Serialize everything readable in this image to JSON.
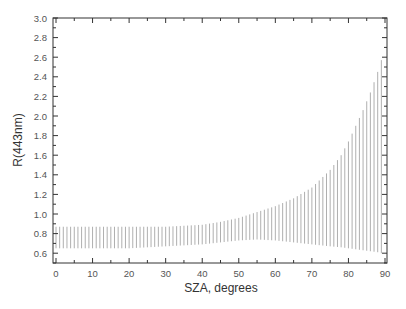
{
  "chart_data": {
    "type": "errorbar",
    "title": "",
    "xlabel": "SZA, degrees",
    "ylabel": "R(443nm)",
    "xlim": [
      -1,
      90
    ],
    "ylim": [
      0.5,
      3.0
    ],
    "grid": false,
    "legend": null,
    "x_ticks": [
      0,
      10,
      20,
      30,
      40,
      50,
      60,
      70,
      80,
      90
    ],
    "x_tick_labels": [
      "0",
      "10",
      "20",
      "30",
      "40",
      "50",
      "60",
      "70",
      "80",
      "90"
    ],
    "y_ticks": [
      0.6,
      0.8,
      1.0,
      1.2,
      1.4,
      1.6,
      1.8,
      2.0,
      2.2,
      2.4,
      2.6,
      2.8,
      3.0
    ],
    "y_tick_labels": [
      "0.6",
      "0.8",
      "1.0",
      "1.2",
      "1.4",
      "1.6",
      "1.8",
      "2.0",
      "2.2",
      "2.4",
      "2.6",
      "2.8",
      "3.0"
    ],
    "series": [
      {
        "name": "R(443nm) range",
        "color": "#9a9a9a",
        "x": [
          0,
          5,
          10,
          15,
          20,
          25,
          30,
          35,
          40,
          45,
          50,
          55,
          60,
          65,
          70,
          75,
          78,
          80,
          82,
          84,
          86,
          88,
          89
        ],
        "upper": [
          0.87,
          0.87,
          0.87,
          0.87,
          0.87,
          0.87,
          0.87,
          0.88,
          0.89,
          0.92,
          0.96,
          1.02,
          1.08,
          1.16,
          1.27,
          1.45,
          1.6,
          1.74,
          1.9,
          2.06,
          2.24,
          2.45,
          2.57
        ],
        "lower": [
          0.65,
          0.65,
          0.65,
          0.65,
          0.65,
          0.66,
          0.67,
          0.68,
          0.69,
          0.71,
          0.73,
          0.74,
          0.73,
          0.71,
          0.69,
          0.67,
          0.66,
          0.65,
          0.64,
          0.63,
          0.62,
          0.61,
          0.6
        ]
      }
    ]
  }
}
